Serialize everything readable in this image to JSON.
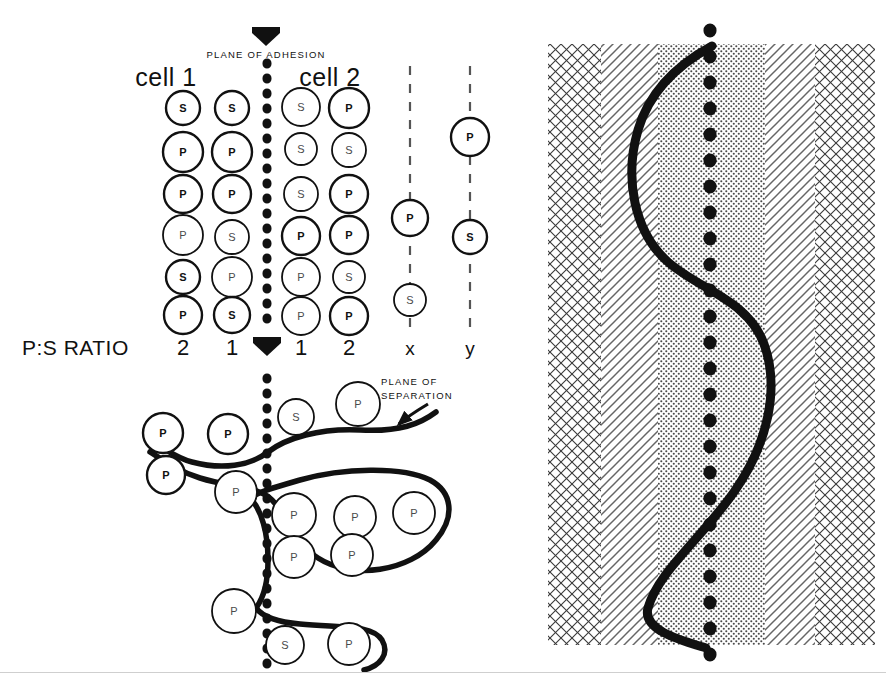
{
  "figure": {
    "title_labels": {
      "plane_of_adhesion": "PLANE OF ADHESION",
      "plane_of_separation_line1": "PLANE OF",
      "plane_of_separation_line2": "SEPARATION",
      "cell_1": "cell 1",
      "cell_2": "cell 2",
      "ps_ratio": "P:S RATIO"
    },
    "colors": {
      "ink": "#111111",
      "glyph": "#4a4a4a",
      "hatch": "#3a3a3a",
      "stipple": "#555555",
      "background": "#ffffff"
    },
    "upper_panel": {
      "ratio_values": [
        "2",
        "1",
        "1",
        "2"
      ],
      "extra_column_labels": [
        "x",
        "y"
      ],
      "columns": [
        {
          "name": "cell1-col1",
          "x": 183,
          "ratio": "2",
          "cells": [
            {
              "label": "S",
              "style": "dark",
              "r": 17,
              "y": 108
            },
            {
              "label": "P",
              "style": "dark",
              "r": 20,
              "y": 152
            },
            {
              "label": "P",
              "style": "dark",
              "r": 19,
              "y": 194
            },
            {
              "label": "P",
              "style": "light",
              "r": 20,
              "y": 235
            },
            {
              "label": "S",
              "style": "dark",
              "r": 17,
              "y": 277
            },
            {
              "label": "P",
              "style": "dark",
              "r": 19,
              "y": 315
            }
          ]
        },
        {
          "name": "cell1-col2",
          "x": 232,
          "ratio": "1",
          "cells": [
            {
              "label": "S",
              "style": "dark",
              "r": 17,
              "y": 108
            },
            {
              "label": "P",
              "style": "dark",
              "r": 20,
              "y": 152
            },
            {
              "label": "P",
              "style": "dark",
              "r": 19,
              "y": 194
            },
            {
              "label": "S",
              "style": "light",
              "r": 17,
              "y": 237
            },
            {
              "label": "P",
              "style": "light",
              "r": 20,
              "y": 277
            },
            {
              "label": "S",
              "style": "dark",
              "r": 18,
              "y": 315
            }
          ]
        },
        {
          "name": "cell2-col1",
          "x": 301,
          "ratio": "1",
          "cells": [
            {
              "label": "S",
              "style": "light",
              "r": 19,
              "y": 107
            },
            {
              "label": "S",
              "style": "light",
              "r": 16,
              "y": 149
            },
            {
              "label": "S",
              "style": "light",
              "r": 17,
              "y": 194
            },
            {
              "label": "P",
              "style": "dark",
              "r": 19,
              "y": 236
            },
            {
              "label": "P",
              "style": "light",
              "r": 19,
              "y": 277
            },
            {
              "label": "P",
              "style": "light",
              "r": 19,
              "y": 316
            }
          ]
        },
        {
          "name": "cell2-col2",
          "x": 349,
          "ratio": "2",
          "cells": [
            {
              "label": "P",
              "style": "dark",
              "r": 20,
              "y": 108
            },
            {
              "label": "S",
              "style": "light",
              "r": 17,
              "y": 150
            },
            {
              "label": "P",
              "style": "dark",
              "r": 19,
              "y": 194
            },
            {
              "label": "P",
              "style": "dark",
              "r": 19,
              "y": 235
            },
            {
              "label": "S",
              "style": "light",
              "r": 16,
              "y": 277
            },
            {
              "label": "P",
              "style": "dark",
              "r": 19,
              "y": 316
            }
          ]
        },
        {
          "name": "column-x",
          "x": 410,
          "ratio": "x",
          "dashed_axis": true,
          "cells": [
            {
              "label": "P",
              "style": "dark",
              "r": 18,
              "y": 218
            },
            {
              "label": "S",
              "style": "light",
              "r": 16,
              "y": 300
            }
          ]
        },
        {
          "name": "column-y",
          "x": 470,
          "ratio": "y",
          "dashed_axis": true,
          "cells": [
            {
              "label": "P",
              "style": "dark",
              "r": 19,
              "y": 137
            },
            {
              "label": "S",
              "style": "dark",
              "r": 17,
              "y": 237
            }
          ]
        }
      ]
    },
    "lower_panel": {
      "cells": [
        {
          "label": "P",
          "style": "dark",
          "r": 20,
          "x": 163,
          "y": 433
        },
        {
          "label": "P",
          "style": "dark",
          "r": 20,
          "x": 228,
          "y": 434
        },
        {
          "label": "P",
          "style": "dark",
          "r": 19,
          "x": 166,
          "y": 475
        },
        {
          "label": "P",
          "style": "light",
          "r": 21,
          "x": 236,
          "y": 492
        },
        {
          "label": "S",
          "style": "light",
          "r": 18,
          "x": 296,
          "y": 417
        },
        {
          "label": "P",
          "style": "light",
          "r": 22,
          "x": 358,
          "y": 404
        },
        {
          "label": "P",
          "style": "light",
          "r": 22,
          "x": 294,
          "y": 515
        },
        {
          "label": "P",
          "style": "light",
          "r": 21,
          "x": 355,
          "y": 517
        },
        {
          "label": "P",
          "style": "light",
          "r": 21,
          "x": 414,
          "y": 513
        },
        {
          "label": "P",
          "style": "light",
          "r": 21,
          "x": 294,
          "y": 557
        },
        {
          "label": "P",
          "style": "light",
          "r": 21,
          "x": 352,
          "y": 555
        },
        {
          "label": "P",
          "style": "light",
          "r": 22,
          "x": 234,
          "y": 611
        },
        {
          "label": "S",
          "style": "light",
          "r": 19,
          "x": 285,
          "y": 645
        },
        {
          "label": "P",
          "style": "light",
          "r": 21,
          "x": 349,
          "y": 644
        }
      ]
    },
    "right_panel": {
      "bands": [
        {
          "name": "crosshatch-left",
          "pattern": "crosshatch",
          "x": 548,
          "width": 53
        },
        {
          "name": "diagonal-left",
          "pattern": "diagonal",
          "x": 601,
          "width": 57
        },
        {
          "name": "stipple-center",
          "pattern": "stipple",
          "x": 658,
          "width": 107
        },
        {
          "name": "diagonal-right",
          "pattern": "diagonal",
          "x": 765,
          "width": 50
        },
        {
          "name": "crosshatch-right",
          "pattern": "crosshatch",
          "x": 815,
          "width": 60
        }
      ],
      "axis_x": 710,
      "panel_top": 44,
      "panel_bottom": 645,
      "curve_description": "sigmoid-wave"
    }
  }
}
